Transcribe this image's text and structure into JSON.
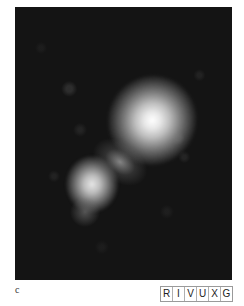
{
  "figure": {
    "panel_label": "c",
    "image_description": "Grayscale astronomical image of two merging bright blobs on dark noisy background",
    "wavelength_bands": [
      "R",
      "I",
      "V",
      "U",
      "X",
      "G"
    ],
    "colors": {
      "background": "#141414",
      "blob_core": "#ffffff",
      "page": "#ffffff"
    }
  }
}
